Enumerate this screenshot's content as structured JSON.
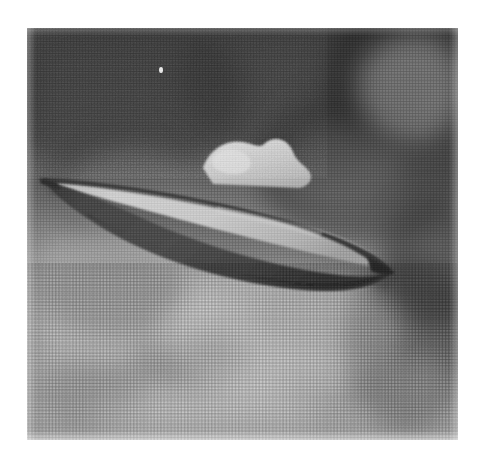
{
  "image": {
    "kind": "photograph",
    "medium": "halftone-printed black-and-white photograph",
    "subject": "unidentified flying object (flying saucer) in a cloudy sky",
    "orientation": "landscape-tilted",
    "canvas": {
      "width": 481,
      "height": 459
    },
    "paper_margin": {
      "left": 27,
      "top": 28,
      "right": 23,
      "bottom": 19
    },
    "photo_area": {
      "x": 27,
      "y": 28,
      "width": 431,
      "height": 412
    }
  },
  "palette": {
    "paper_white": "#ffffff",
    "sky_dark": "#4f4f4f",
    "sky_mid": "#7d7d7d",
    "sky_light": "#bdbdbd",
    "craft_hull_dark": "#3c3c3c",
    "craft_hull_mid": "#4e4e4e",
    "craft_deck_light": "#c9c9c9",
    "craft_dome_light": "#cfcfcf",
    "craft_rim_shadow": "#2f2f2f",
    "speck_white": "#e8e8e8"
  },
  "scene": {
    "background_label": "overcast cloudy sky",
    "tone_gradient": "dark grey at top, pale grey haze at bottom",
    "clouds": [
      {
        "name": "upper-left-dark-mass",
        "x": -30,
        "y": -20,
        "w": 250,
        "h": 170,
        "tone": "dark"
      },
      {
        "name": "upper-mid-dark-mass",
        "x": 150,
        "y": -40,
        "w": 260,
        "h": 180,
        "tone": "dark"
      },
      {
        "name": "upper-right-dark-mass",
        "x": 300,
        "y": -30,
        "w": 160,
        "h": 150,
        "tone": "dark"
      },
      {
        "name": "left-dark-patch",
        "x": 18,
        "y": 100,
        "w": 150,
        "h": 110,
        "tone": "dark"
      },
      {
        "name": "right-dark-bank",
        "x": 230,
        "y": 60,
        "w": 210,
        "h": 160,
        "tone": "dark"
      },
      {
        "name": "lower-left-dark-patch",
        "x": 10,
        "y": 215,
        "w": 150,
        "h": 95,
        "tone": "dark"
      },
      {
        "name": "right-edge-dark-column",
        "x": 318,
        "y": 225,
        "w": 130,
        "h": 180,
        "tone": "dark"
      },
      {
        "name": "upper-right-bright-gap",
        "x": 330,
        "y": 5,
        "w": 110,
        "h": 110,
        "tone": "light"
      },
      {
        "name": "left-bright-haze",
        "x": 0,
        "y": 205,
        "w": 190,
        "h": 130,
        "tone": "light"
      },
      {
        "name": "lower-bright-haze",
        "x": 135,
        "y": 240,
        "w": 240,
        "h": 130,
        "tone": "light"
      }
    ],
    "speck": {
      "name": "bright-speck",
      "x": 161,
      "y": 70,
      "note": "small white dot in upper sky"
    }
  },
  "craft": {
    "label": "flying saucer",
    "shape": "lens / disc seen nearly edge-on, tilted",
    "tilt_description": "left tip high, right tip low",
    "left_tip": {
      "x": 45,
      "y": 181
    },
    "right_tip": {
      "x": 392,
      "y": 269
    },
    "span_px": 347,
    "max_thickness_px": 52,
    "parts": [
      {
        "name": "upper-rim",
        "description": "thin dark arc forming the top edge of the disc"
      },
      {
        "name": "upper-deck",
        "description": "bright sunlit top surface of the disc"
      },
      {
        "name": "lower-hull",
        "description": "large dark underside body of the disc"
      },
      {
        "name": "dome",
        "description": "irregular bright superstructure on top, left of centre"
      }
    ],
    "dome": {
      "center_x": 245,
      "top_y": 141,
      "width": 95,
      "height": 46
    }
  },
  "print_artifacts": {
    "halftone": "visible dot screen, ~3px pitch, strongest in pale lower half",
    "grain": "heavy film grain throughout",
    "streaks": "faint horizontal scan lines from reproduction",
    "vignette": "slight edge darkening"
  }
}
